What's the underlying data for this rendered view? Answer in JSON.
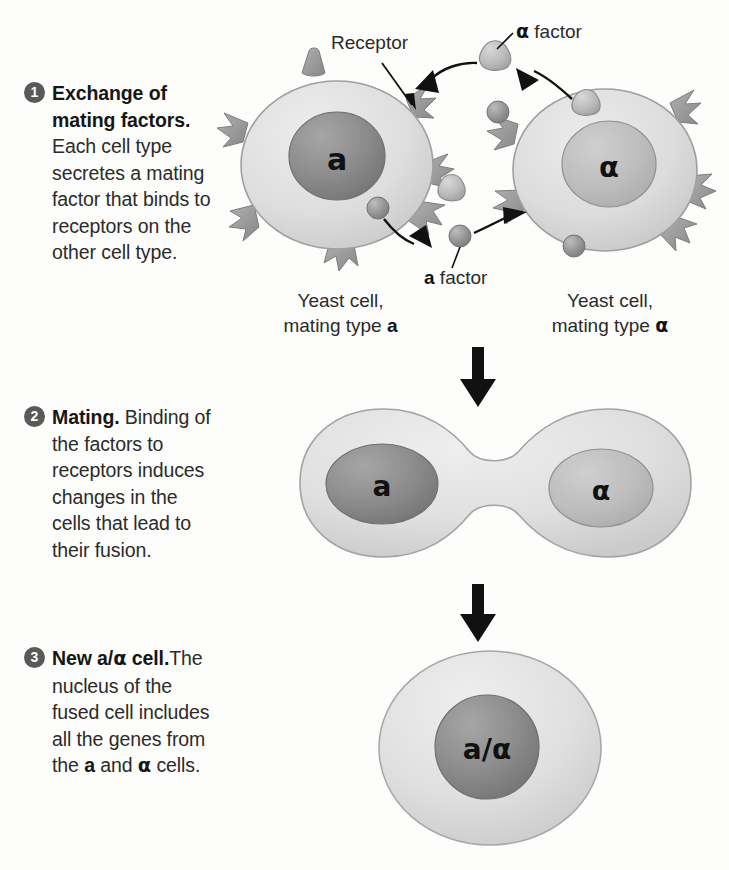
{
  "figure": {
    "background_color": "#fdfdfb",
    "ink_color": "#2b2b2b",
    "step_badge_color": "#595959",
    "cell_body_color": "#dcdcdc",
    "cell_outline_color": "#a8a8a8",
    "nucleus_dark_color": "#8a8a8a",
    "nucleus_light_color": "#bfbfbf",
    "receptor_color": "#9a9a9a",
    "arrow_color": "#111111"
  },
  "steps": [
    {
      "number": "1",
      "heading": "Exchange of mating factors.",
      "body": " Each cell type secretes a mating factor that binds to receptors on the other cell type."
    },
    {
      "number": "2",
      "heading": "Mating.",
      "body": " Binding of the factors to receptors induces changes in the cells that lead to their fusion."
    },
    {
      "number": "3",
      "heading_pre": "New a/",
      "heading_sym": "α",
      "heading_post": " cell.",
      "body_1": "The nucleus of the fused cell includes all the genes from the ",
      "body_a": "a",
      "body_2": " and ",
      "body_alpha": "α",
      "body_3": " cells."
    }
  ],
  "diagram": {
    "stage1": {
      "receptor_label": "Receptor",
      "alpha_factor_label_sym": "α",
      "alpha_factor_label_text": " factor",
      "a_factor_label_sym": "a",
      "a_factor_label_text": " factor",
      "left_cell_caption_line1": "Yeast cell,",
      "left_cell_caption_line2_pre": "mating type ",
      "left_cell_caption_line2_sym": "a",
      "right_cell_caption_line1": "Yeast cell,",
      "right_cell_caption_line2_pre": "mating type ",
      "right_cell_caption_line2_sym": "α",
      "left_nucleus_label": "a",
      "right_nucleus_label": "α"
    },
    "stage2": {
      "left_nucleus_label": "a",
      "right_nucleus_label": "α"
    },
    "stage3": {
      "nucleus_label": "a/α"
    }
  }
}
